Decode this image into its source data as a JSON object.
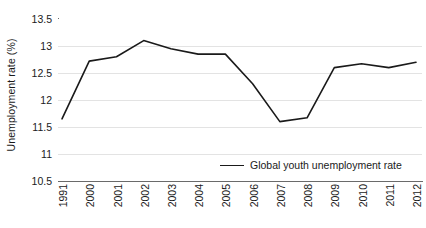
{
  "chart_data": {
    "type": "line",
    "title": "",
    "xlabel": "",
    "ylabel": "Unemployment rate (%)",
    "categories": [
      "1991",
      "2000",
      "2001",
      "2002",
      "2003",
      "2004",
      "2005",
      "2006",
      "2007",
      "2008",
      "2009",
      "2010",
      "2011",
      "2012"
    ],
    "series": [
      {
        "name": "Global youth unemployment rate",
        "color": "#1a1a1a",
        "values": [
          11.65,
          12.72,
          12.8,
          13.1,
          12.95,
          12.85,
          12.85,
          12.3,
          11.6,
          11.67,
          12.6,
          12.67,
          12.6,
          12.7
        ]
      }
    ],
    "ylim": [
      10.5,
      13.5
    ],
    "yticks": [
      10.5,
      11,
      11.5,
      12,
      12.5,
      13,
      13.5
    ],
    "ytick_labels": [
      "10.5",
      "11",
      "11.5",
      "12",
      "12.5",
      "13",
      "13.5"
    ],
    "grid": true,
    "grid_axis": "y",
    "grid_color": "#e3e3e3",
    "legend_position": "bottom-center",
    "background_color": "#ffffff",
    "axis_color": "#6a6a6a",
    "xtick_rotation": 90
  },
  "legend": {
    "entries": [
      {
        "label": "Global youth unemployment rate",
        "swatch": "line-swatch"
      }
    ]
  }
}
